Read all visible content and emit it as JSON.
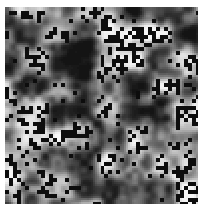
{
  "image": {
    "kind": "grayscale-noise-texture",
    "title": "Grayscale speckled noise texture",
    "width": 198,
    "height": 204,
    "background_color": "#ffffff",
    "margins": {
      "left": 5,
      "top": 7,
      "right": 0,
      "bottom": 0
    },
    "content": {
      "x": 5,
      "y": 7,
      "width": 193,
      "height": 197
    },
    "colorspace": "grayscale",
    "tone_range": {
      "darkest": "#141414",
      "brightest": "#f7f7f7",
      "midtone": "#8a8a8a"
    },
    "base_layer": {
      "name": "smooth-blob-noise",
      "description": "Low-frequency value noise forming soft rounded blobs with smooth gradients",
      "blob_scale_px": 26,
      "octaves": 3,
      "lacunarity": 2.0,
      "gain": 0.5,
      "contrast": 1.55,
      "seed": 20240517
    },
    "speckle_layer": {
      "name": "dark-speckle-overlay",
      "description": "Sharp near-black square speckles clustered in bright regions, sparse in dark regions",
      "color": "#0d0d0d",
      "cell_size_px": 3,
      "count_approx": 520,
      "brightness_weighted": true,
      "brightness_threshold": 0.46,
      "seed": 991733
    },
    "quantization": {
      "pixel_block": 2,
      "levels": 64
    }
  }
}
